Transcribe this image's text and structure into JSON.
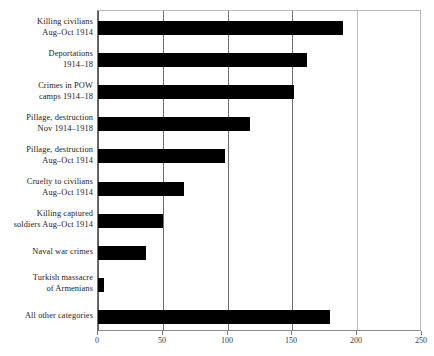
{
  "chart_data": {
    "type": "bar",
    "orientation": "horizontal",
    "title": "",
    "subtitle": "",
    "xlabel": "",
    "ylabel": "",
    "xlim": [
      0,
      250
    ],
    "xticks": [
      0,
      50,
      100,
      150,
      200,
      250
    ],
    "xtick_labels": [
      "0",
      "50",
      "100",
      "150",
      "200",
      "250"
    ],
    "grid": true,
    "grid_axis": "x",
    "legend": false,
    "bar_color": "#000000",
    "background_color": "#ffffff",
    "gridline_color": "#6e6e6e",
    "categories": [
      "Killing civilians Aug–Oct 1914",
      "Deportations 1914–18",
      "Crimes in POW camps 1914–18",
      "Pillage, destruction Nov 1914–1918",
      "Pillage, destruction Aug–Oct 1914",
      "Cruelty to civilians Aug–Oct 1914",
      "Killing captured soldiers Aug–Oct 1914",
      "Naval war crimes",
      "Turkish massacre of Armenians",
      "All other categories"
    ],
    "category_lines": [
      [
        "Killing civilians",
        "Aug–Oct 1914"
      ],
      [
        "Deportations",
        "1914–18"
      ],
      [
        "Crimes in POW",
        "camps 1914–18"
      ],
      [
        "Pillage, destruction",
        "Nov 1914–1918"
      ],
      [
        "Pillage, destruction",
        "Aug–Oct 1914"
      ],
      [
        "Cruelty to civilians",
        "Aug–Oct 1914"
      ],
      [
        "Killing captured",
        "soldiers Aug–Oct 1914"
      ],
      [
        "Naval war crimes"
      ],
      [
        "Turkish massacre",
        "of Armenians"
      ],
      [
        "All other categories"
      ]
    ],
    "values": [
      189,
      161,
      151,
      117,
      98,
      66,
      50,
      37,
      5,
      179
    ]
  }
}
